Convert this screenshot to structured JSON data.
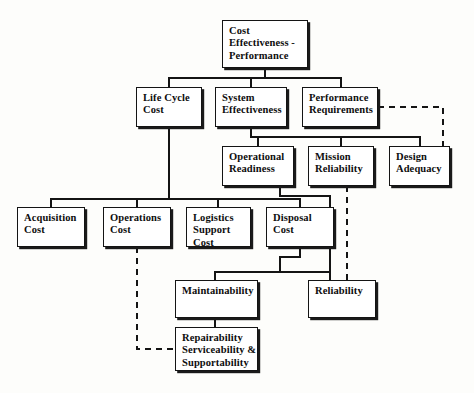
{
  "diagram": {
    "title": "Cost Effectiveness - Performance",
    "type": "hierarchy-tree",
    "canvas": {
      "width": 474,
      "height": 393
    },
    "colors": {
      "box_border": "#141414",
      "box_fill": "#ffffff",
      "shadow": "#1a1a1a",
      "connector_solid": "#141414",
      "connector_dashed": "#141414",
      "background": "#fdfdfb",
      "text": "#0d0d0d"
    },
    "nodes": [
      {
        "id": "cost-effectiveness-performance",
        "lines": [
          "Cost",
          "Effectiveness -",
          "Performance"
        ],
        "level": 0,
        "x": 222,
        "y": 20,
        "w": 86,
        "h": 48
      },
      {
        "id": "life-cycle-cost",
        "lines": [
          "Life Cycle",
          "Cost"
        ],
        "level": 1,
        "x": 136,
        "y": 87,
        "w": 66,
        "h": 40
      },
      {
        "id": "system-effectiveness",
        "lines": [
          "System",
          "Effectiveness"
        ],
        "level": 1,
        "x": 215,
        "y": 87,
        "w": 72,
        "h": 40
      },
      {
        "id": "performance-requirements",
        "lines": [
          "Performance",
          "Requirements"
        ],
        "level": 1,
        "x": 302,
        "y": 87,
        "w": 76,
        "h": 40
      },
      {
        "id": "operational-readiness",
        "lines": [
          "Operational",
          "Readiness"
        ],
        "level": 2,
        "x": 222,
        "y": 146,
        "w": 72,
        "h": 40
      },
      {
        "id": "mission-reliability",
        "lines": [
          "Mission",
          "Reliability"
        ],
        "level": 2,
        "x": 308,
        "y": 146,
        "w": 66,
        "h": 40
      },
      {
        "id": "design-adequacy",
        "lines": [
          "Design",
          "Adequacy"
        ],
        "level": 2,
        "x": 389,
        "y": 146,
        "w": 61,
        "h": 40
      },
      {
        "id": "acquisition-cost",
        "lines": [
          "Acquisition",
          "Cost"
        ],
        "level": 3,
        "x": 17,
        "y": 207,
        "w": 68,
        "h": 40
      },
      {
        "id": "operations-cost",
        "lines": [
          "Operations",
          "Cost"
        ],
        "level": 3,
        "x": 103,
        "y": 207,
        "w": 68,
        "h": 40
      },
      {
        "id": "logistics-support-cost",
        "lines": [
          "Logistics",
          "Support",
          "Cost"
        ],
        "level": 3,
        "x": 186,
        "y": 207,
        "w": 65,
        "h": 40
      },
      {
        "id": "disposal-cost",
        "lines": [
          "Disposal",
          "Cost"
        ],
        "level": 3,
        "x": 266,
        "y": 207,
        "w": 68,
        "h": 40
      },
      {
        "id": "maintainability",
        "lines": [
          "Maintainability"
        ],
        "level": 4,
        "x": 175,
        "y": 280,
        "w": 83,
        "h": 38
      },
      {
        "id": "reliability",
        "lines": [
          "Reliability"
        ],
        "level": 4,
        "x": 308,
        "y": 280,
        "w": 68,
        "h": 38
      },
      {
        "id": "repairability-serviceability-supportability",
        "lines": [
          "Repairability",
          "Serviceability &",
          "Supportability"
        ],
        "level": 5,
        "x": 175,
        "y": 327,
        "w": 83,
        "h": 44
      }
    ],
    "edges": [
      {
        "from": "cost-effectiveness-performance",
        "to": "life-cycle-cost",
        "style": "solid"
      },
      {
        "from": "cost-effectiveness-performance",
        "to": "system-effectiveness",
        "style": "solid"
      },
      {
        "from": "cost-effectiveness-performance",
        "to": "performance-requirements",
        "style": "solid"
      },
      {
        "from": "system-effectiveness",
        "to": "operational-readiness",
        "style": "solid"
      },
      {
        "from": "system-effectiveness",
        "to": "mission-reliability",
        "style": "solid"
      },
      {
        "from": "system-effectiveness",
        "to": "design-adequacy",
        "style": "solid"
      },
      {
        "from": "performance-requirements",
        "to": "design-adequacy",
        "style": "dashed"
      },
      {
        "from": "life-cycle-cost",
        "to": "acquisition-cost",
        "style": "solid"
      },
      {
        "from": "life-cycle-cost",
        "to": "operations-cost",
        "style": "solid"
      },
      {
        "from": "life-cycle-cost",
        "to": "logistics-support-cost",
        "style": "solid"
      },
      {
        "from": "life-cycle-cost",
        "to": "disposal-cost",
        "style": "solid"
      },
      {
        "from": "operational-readiness",
        "to": "maintainability",
        "style": "solid"
      },
      {
        "from": "operational-readiness",
        "to": "reliability",
        "style": "solid"
      },
      {
        "from": "mission-reliability",
        "to": "reliability",
        "style": "dashed"
      },
      {
        "from": "maintainability",
        "to": "repairability-serviceability-supportability",
        "style": "solid"
      },
      {
        "from": "operations-cost",
        "to": "repairability-serviceability-supportability",
        "style": "dashed"
      }
    ]
  }
}
